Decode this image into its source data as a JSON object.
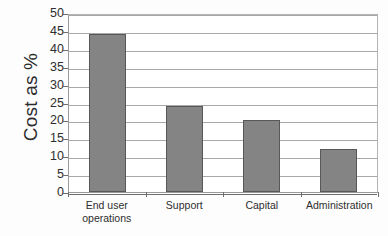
{
  "chart_data": {
    "type": "bar",
    "title": "",
    "subtitle": "",
    "xlabel": "",
    "ylabel": "Cost as %",
    "categories": [
      "End user operations",
      "Support",
      "Capital",
      "Administration"
    ],
    "category_lines": [
      [
        "End user",
        "operations"
      ],
      [
        "Support"
      ],
      [
        "Capital"
      ],
      [
        "Administration"
      ]
    ],
    "values": [
      44,
      24,
      20,
      12
    ],
    "series": [
      {
        "name": "Cost as %",
        "values": [
          44,
          24,
          20,
          12
        ]
      }
    ],
    "ylim": [
      0,
      50
    ],
    "ytick_step": 5,
    "yticks": [
      50,
      45,
      40,
      35,
      30,
      25,
      20,
      15,
      10,
      5,
      0
    ],
    "ytick_labels": [
      "50",
      "45",
      "40",
      "35",
      "30",
      "25",
      "20",
      "15",
      "10",
      "5",
      "0"
    ],
    "grid": true,
    "grid_axis": "y",
    "legend": false,
    "legend_position": "none",
    "annotations": [],
    "colors": {
      "bar_fill": "#848484",
      "bar_border": "#585858",
      "gridline": "#a8a8a8",
      "axis": "#6e6e6e",
      "plot_border": "#9a9a9a",
      "text": "#2e2e2e",
      "background": "#ffffff"
    }
  }
}
